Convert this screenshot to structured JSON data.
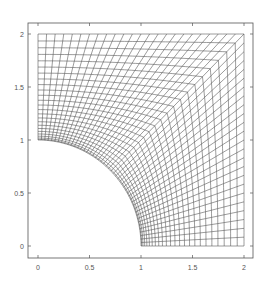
{
  "figure": {
    "domain": {
      "xmin": 0,
      "xmax": 2,
      "ymin": 0,
      "ymax": 2
    },
    "hole": {
      "shape": "quarter-circle",
      "center": [
        0,
        0
      ],
      "radius": 1
    },
    "mesh": {
      "angular_divisions_per_edge": 24,
      "radial_divisions": 24,
      "radial_clustering": 1.6
    },
    "colors": {
      "mesh_line": "#4a4a4a",
      "frame": "#555555",
      "background": "#ffffff"
    }
  },
  "axes": {
    "x_ticks": [
      {
        "value": 0,
        "label": "0"
      },
      {
        "value": 0.5,
        "label": "0.5"
      },
      {
        "value": 1,
        "label": "1"
      },
      {
        "value": 1.5,
        "label": "1.5"
      },
      {
        "value": 2,
        "label": "2"
      }
    ],
    "y_ticks": [
      {
        "value": 0,
        "label": "0"
      },
      {
        "value": 0.5,
        "label": "0.5"
      },
      {
        "value": 1,
        "label": "1"
      },
      {
        "value": 1.5,
        "label": "1.5"
      },
      {
        "value": 2,
        "label": "2"
      }
    ]
  }
}
